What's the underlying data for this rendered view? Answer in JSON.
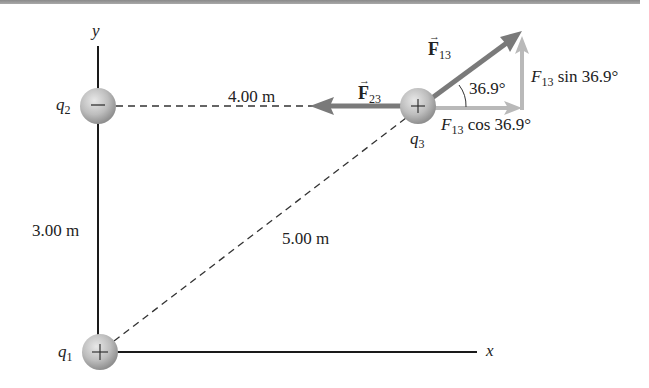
{
  "figure": {
    "axes": {
      "x_label": "x",
      "y_label": "y"
    },
    "charges": [
      {
        "id": "q1",
        "label": "q",
        "sub": "1",
        "sign": "+",
        "cx": 100,
        "cy": 352
      },
      {
        "id": "q2",
        "label": "q",
        "sub": "2",
        "sign": "−",
        "cx": 98,
        "cy": 106
      },
      {
        "id": "q3",
        "label": "q",
        "sub": "3",
        "sign": "+",
        "cx": 418,
        "cy": 106
      }
    ],
    "distances": {
      "q2_q3": "4.00 m",
      "q1_q2": "3.00 m",
      "q1_q3": "5.00 m"
    },
    "forces": {
      "F13": {
        "symbol": "F",
        "sub": "13",
        "angle_label": "36.9°"
      },
      "F23": {
        "symbol": "F",
        "sub": "23"
      }
    },
    "components": {
      "x_comp": {
        "prefix": "F",
        "sub": "13",
        "text": " cos 36.9°"
      },
      "y_comp": {
        "prefix": "F",
        "sub": "13",
        "text": " sin 36.9°"
      }
    },
    "colors": {
      "force_arrow": "#7a7a7a",
      "component_arrow": "#b9b9b9",
      "charge_fill": "#bdbdbd",
      "axis": "#1a1a1a"
    }
  }
}
